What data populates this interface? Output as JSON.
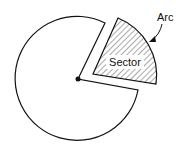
{
  "diagram": {
    "labels": {
      "sector": "Sector",
      "arc": "Arc"
    },
    "colors": {
      "stroke": "#111111",
      "background": "#ffffff",
      "hatch": "#555555"
    },
    "elements": [
      {
        "name": "circle-remainder",
        "description": "major portion of circle with wedge removed"
      },
      {
        "name": "sector",
        "description": "hatched wedge displaced from circle"
      },
      {
        "name": "center-point",
        "description": "filled dot at circle center"
      },
      {
        "name": "arc-pointer",
        "description": "curved arrow from Arc label to sector arc"
      }
    ]
  }
}
